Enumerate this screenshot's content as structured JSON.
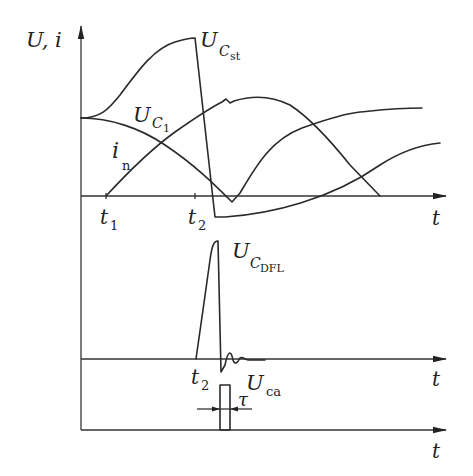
{
  "diagram": {
    "type": "timing-waveforms",
    "y_axis_label": "U, i",
    "x_axis_label": "t",
    "panels": [
      {
        "id": "top",
        "curves": [
          {
            "name": "U_Cst",
            "label_main": "U",
            "label_sub": "C",
            "label_subsub": "st"
          },
          {
            "name": "U_C1",
            "label_main": "U",
            "label_sub": "C",
            "label_subsub": "1"
          },
          {
            "name": "i_n",
            "label_main": "i",
            "label_sub": "n"
          }
        ],
        "ticks": [
          {
            "main": "t",
            "sub": "1"
          },
          {
            "main": "t",
            "sub": "2"
          }
        ],
        "axis_label": "t"
      },
      {
        "id": "middle",
        "curves": [
          {
            "name": "U_CDFL",
            "label_main": "U",
            "label_sub": "C",
            "label_subsub": "DFL"
          }
        ],
        "ticks": [
          {
            "main": "t",
            "sub": "2"
          }
        ],
        "axis_label": "t"
      },
      {
        "id": "bottom",
        "curves": [
          {
            "name": "U_ca",
            "label_main": "U",
            "label_sub": "ca"
          }
        ],
        "annotation": "τ",
        "axis_label": "t"
      }
    ]
  }
}
